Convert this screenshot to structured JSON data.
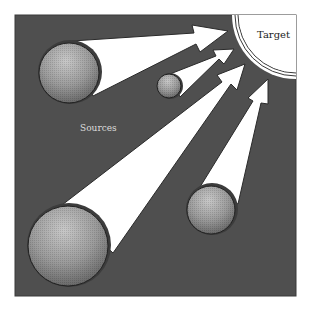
{
  "diagram": {
    "labels": {
      "target": "Target",
      "sources": "Sources"
    },
    "colors": {
      "background": "#4f4f4f",
      "arrow_fill": "#ffffff",
      "outline": "#2a2a2a",
      "sphere_light": "#c2c2c2",
      "sphere_dark": "#6a6a6a",
      "page": "#ffffff"
    },
    "frame": {
      "x": 15,
      "y": 15,
      "width": 281,
      "height": 281
    },
    "target": {
      "cx": 296,
      "cy": 15,
      "r": 62
    },
    "sources": [
      {
        "id": "source-1",
        "cx": 70,
        "cy": 72,
        "r": 31,
        "size": "large"
      },
      {
        "id": "source-2",
        "cx": 169,
        "cy": 86,
        "r": 12,
        "size": "small"
      },
      {
        "id": "source-3",
        "cx": 68,
        "cy": 246,
        "r": 40,
        "size": "largest"
      },
      {
        "id": "source-4",
        "cx": 211,
        "cy": 210,
        "r": 25,
        "size": "medium"
      }
    ],
    "arrows": [
      {
        "from": "source-1",
        "to": "target",
        "tip": [
          228,
          31
        ]
      },
      {
        "from": "source-2",
        "to": "target",
        "tip": [
          234,
          49
        ]
      },
      {
        "from": "source-3",
        "to": "target",
        "tip": [
          245,
          64
        ]
      },
      {
        "from": "source-4",
        "to": "target",
        "tip": [
          268,
          79
        ]
      }
    ]
  }
}
